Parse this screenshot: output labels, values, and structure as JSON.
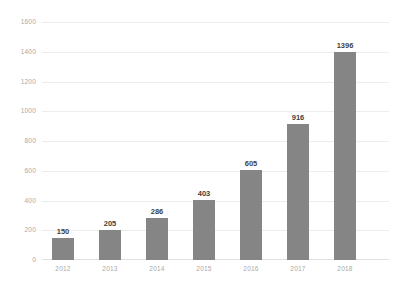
{
  "chart_data": {
    "type": "bar",
    "title": "",
    "subtitle": "",
    "xlabel": "",
    "ylabel": "",
    "categories": [
      "2012",
      "2013",
      "2014",
      "2015",
      "2016",
      "2017",
      "2018"
    ],
    "values": [
      150,
      205,
      286,
      403,
      605,
      916,
      1396
    ],
    "data_labels": [
      "150",
      "205",
      "286",
      "403",
      "605",
      "916",
      "1396"
    ],
    "ylim": [
      0,
      1600
    ],
    "ytick_values": [
      0,
      200,
      400,
      600,
      800,
      1000,
      1200,
      1400,
      1600
    ],
    "ytick_labels": [
      "0",
      "200",
      "400",
      "600",
      "800",
      "1000",
      "1200",
      "1400",
      "1600"
    ],
    "grid": true,
    "grid_axis": "y",
    "legend": false,
    "legend_position": "none",
    "series": [
      {
        "name": "",
        "values": [
          150,
          205,
          286,
          403,
          605,
          916,
          1396
        ]
      }
    ]
  },
  "style": {
    "background_color": "#ffffff",
    "bar_color": "#858585",
    "gridline_color": "#ededed",
    "axis_label_color": "#a9a9a9",
    "data_label_color": "#3f3f3f"
  }
}
